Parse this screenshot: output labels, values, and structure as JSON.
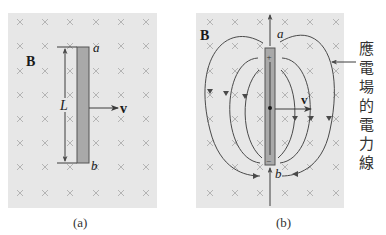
{
  "panel_a": {
    "field_label": "B",
    "top_end_label": "a",
    "bottom_end_label": "b",
    "length_label": "L",
    "velocity_label": "v",
    "caption": "(a)"
  },
  "panel_b": {
    "field_label": "B",
    "top_end_label": "a",
    "bottom_end_label": "b",
    "velocity_label": "v",
    "plus_sign": "+",
    "minus_sign": "−",
    "caption": "(b)",
    "annotation_chars": [
      "應",
      "電",
      "場",
      "的",
      "電",
      "力",
      "線"
    ]
  },
  "colors": {
    "background": "#e7e7e7",
    "rod_fill": "#a9a9a9",
    "rod_stroke": "#555555",
    "x_mark": "#b4b4b4",
    "line": "#3c3c3c"
  }
}
